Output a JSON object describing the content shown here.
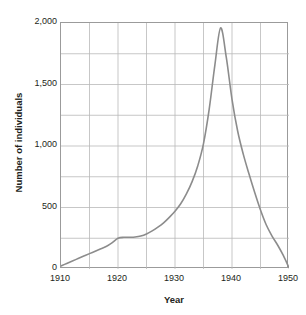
{
  "chart_data": {
    "type": "line",
    "title_visible_fragment": "",
    "xlabel": "Year",
    "ylabel": "Number of individuals",
    "xlim": [
      1910,
      1950
    ],
    "ylim": [
      0,
      2000
    ],
    "grid": true,
    "grid_x_step": 5,
    "grid_y_step": 250,
    "legend": null,
    "legend_position": "none",
    "line_color": "#8c8c8c",
    "line_width": 1.6,
    "xticks": [
      1910,
      1920,
      1930,
      1940,
      1950
    ],
    "xtick_labels": [
      "1910",
      "1920",
      "1930",
      "1940",
      "1950"
    ],
    "yticks": [
      0,
      500,
      1000,
      1500,
      2000
    ],
    "ytick_labels": [
      "0",
      "500",
      "1,000",
      "1,500",
      "2,000"
    ],
    "series": [
      {
        "name": "Number of individuals",
        "x": [
          1910,
          1911,
          1912,
          1913,
          1914,
          1915,
          1916,
          1917,
          1918,
          1919,
          1920,
          1921,
          1922,
          1923,
          1924,
          1925,
          1926,
          1927,
          1928,
          1929,
          1930,
          1931,
          1932,
          1933,
          1934,
          1935,
          1936,
          1937,
          1938,
          1939,
          1940,
          1941,
          1942,
          1943,
          1944,
          1945,
          1946,
          1947,
          1948,
          1949,
          1950
        ],
        "values": [
          25,
          45,
          65,
          85,
          105,
          125,
          145,
          165,
          185,
          215,
          250,
          258,
          258,
          260,
          268,
          285,
          310,
          340,
          375,
          420,
          470,
          530,
          610,
          710,
          840,
          1020,
          1300,
          1660,
          1960,
          1720,
          1380,
          1120,
          930,
          770,
          620,
          480,
          360,
          270,
          195,
          110,
          10
        ]
      }
    ],
    "annotations": {
      "peak_year": 1938,
      "peak_value": 1960,
      "plateau_years": [
        1920,
        1925
      ],
      "plateau_value": 260,
      "start_value": 25,
      "end_value": 10
    }
  }
}
